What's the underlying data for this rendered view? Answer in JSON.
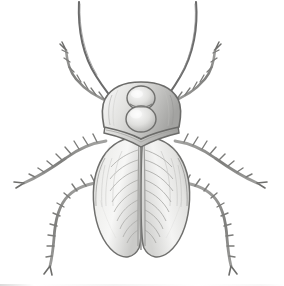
{
  "image": {
    "title": "Beetle, dorsal view",
    "medium": "graphite pencil illustration",
    "subject": "beetle",
    "view": "dorsal",
    "background_color": "#ffffff",
    "alt_text": "Pencil drawing of a beetle seen from above with two long upswept antennae, a rounded pronotum marked with a figure-eight pattern, two large shaded elytra showing herringbone venation, and six spiny legs."
  },
  "palette": {
    "background": "#ffffff",
    "outline": "#6e6e6e",
    "outline_dark": "#4a4a4a",
    "shade_light": "#f0f0ef",
    "shade_mid": "#d4d4d2",
    "shade_deep": "#a9a9a7",
    "shade_darkest": "#8a8a88",
    "leg_fill": "#8f8f8d",
    "vein": "#9a9a98"
  },
  "anatomy": {
    "parts": [
      {
        "name": "antenna-left",
        "label": "Left antenna",
        "count": 1
      },
      {
        "name": "antenna-right",
        "label": "Right antenna",
        "count": 1
      },
      {
        "name": "head-pronotum",
        "label": "Head and pronotum",
        "count": 1
      },
      {
        "name": "pronotum-marking",
        "label": "Figure-eight marking",
        "count": 1
      },
      {
        "name": "thoracic-band",
        "label": "Thoracic band",
        "count": 1
      },
      {
        "name": "elytron-left",
        "label": "Left elytron",
        "count": 1
      },
      {
        "name": "elytron-right",
        "label": "Right elytron",
        "count": 1
      },
      {
        "name": "leg-foreleg-left",
        "label": "Left foreleg",
        "count": 1
      },
      {
        "name": "leg-foreleg-right",
        "label": "Right foreleg",
        "count": 1
      },
      {
        "name": "leg-midleg-left",
        "label": "Left mid leg",
        "count": 1
      },
      {
        "name": "leg-midleg-right",
        "label": "Right mid leg",
        "count": 1
      },
      {
        "name": "leg-hindleg-left",
        "label": "Left hind leg",
        "count": 1
      },
      {
        "name": "leg-hindleg-right",
        "label": "Right hind leg",
        "count": 1
      }
    ],
    "leg_total": 6,
    "antenna_total": 2,
    "elytra_total": 2
  },
  "caption": ""
}
